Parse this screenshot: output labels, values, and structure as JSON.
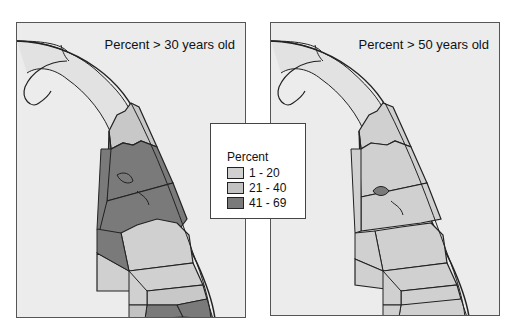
{
  "panels": [
    {
      "id": "left",
      "title": "Percent > 30 years old"
    },
    {
      "id": "right",
      "title": "Percent > 50 years old"
    }
  ],
  "legend": {
    "title": "Percent",
    "items": [
      {
        "label": "1 - 20",
        "color": "#d0d0d0"
      },
      {
        "label": "21 - 40",
        "color": "#c2c2c2"
      },
      {
        "label": "41 - 69",
        "color": "#7a7a7a"
      }
    ]
  },
  "colors": {
    "background": "#ececec",
    "low": "#d0d0d0",
    "mid": "#c2c2c2",
    "high": "#7a7a7a",
    "border": "#222222"
  }
}
